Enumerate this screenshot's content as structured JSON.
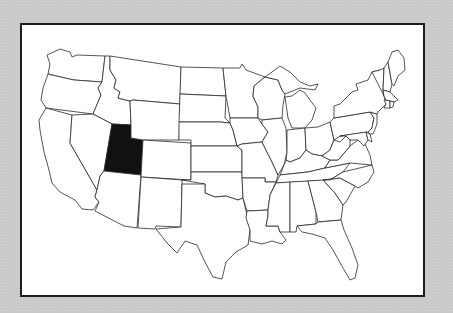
{
  "map": {
    "region": "Contiguous United States",
    "highlighted_state": "Utah",
    "highlight_color": "#111111",
    "base_color": "#ffffff",
    "border_color": "#2a2a2a",
    "background_color": "#c9c9c9",
    "states": [
      "Washington",
      "Oregon",
      "California",
      "Idaho",
      "Nevada",
      "Utah",
      "Arizona",
      "Montana",
      "Wyoming",
      "Colorado",
      "New Mexico",
      "North Dakota",
      "South Dakota",
      "Nebraska",
      "Kansas",
      "Oklahoma",
      "Texas",
      "Minnesota",
      "Iowa",
      "Missouri",
      "Arkansas",
      "Louisiana",
      "Wisconsin",
      "Illinois",
      "Michigan",
      "Indiana",
      "Ohio",
      "Kentucky",
      "Tennessee",
      "Mississippi",
      "Alabama",
      "Georgia",
      "Florida",
      "South Carolina",
      "North Carolina",
      "Virginia",
      "West Virginia",
      "Pennsylvania",
      "New York",
      "Maryland",
      "New Jersey",
      "Delaware",
      "Vermont",
      "New Hampshire",
      "Maine",
      "Massachusetts",
      "Connecticut",
      "Rhode Island"
    ]
  }
}
